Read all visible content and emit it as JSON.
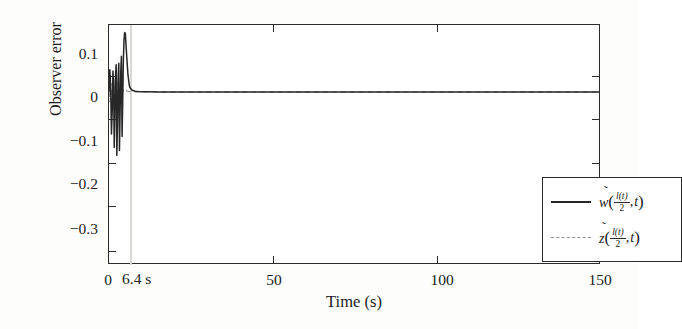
{
  "chart_data": {
    "type": "line",
    "title": "",
    "xlabel": "Time (s)",
    "ylabel": "Observer error",
    "xlim": [
      0,
      150
    ],
    "ylim": [
      -0.345,
      0.135
    ],
    "xticks": [
      0,
      50,
      100,
      150
    ],
    "xticklabels": [
      "0",
      "50",
      "100",
      "150"
    ],
    "yticks": [
      0.1,
      0,
      -0.1,
      -0.2,
      -0.3
    ],
    "yticklabels": [
      "0.1",
      "0",
      "−0.1",
      "−0.2",
      "−0.3"
    ],
    "grid": false,
    "legend_position": "center-right",
    "annotations": [
      {
        "text": "6.4 s",
        "x": 6.4,
        "y": -0.345,
        "type": "settling-time-marker"
      }
    ],
    "series": [
      {
        "name": "w-tilde",
        "label_parts": {
          "symbol": "w",
          "tilde": "̃",
          "numerator": "l(t)",
          "denominator": "2",
          "second_arg": "t"
        },
        "style": "solid",
        "color": "#272727",
        "x": [
          0,
          0.25,
          0.5,
          0.75,
          1.0,
          1.2,
          1.4,
          1.6,
          1.8,
          2.0,
          2.2,
          2.4,
          2.6,
          2.8,
          3.0,
          3.2,
          3.4,
          3.6,
          3.8,
          4.0,
          4.2,
          4.4,
          4.6,
          4.8,
          5.0,
          5.4,
          5.8,
          6.2,
          6.4,
          7.0,
          8.0,
          9.0,
          10.0,
          12.0,
          15.0,
          20.0,
          30.0,
          50.0,
          75.0,
          100.0,
          125.0,
          150.0
        ],
        "y": [
          0.0,
          0.045,
          0.012,
          -0.085,
          -0.035,
          0.042,
          0.02,
          -0.112,
          -0.05,
          0.035,
          0.055,
          -0.128,
          -0.06,
          0.03,
          0.058,
          -0.118,
          -0.04,
          0.04,
          0.072,
          -0.09,
          -0.02,
          0.065,
          0.105,
          0.12,
          0.118,
          0.075,
          0.035,
          0.014,
          0.009,
          0.004,
          0.0015,
          0.0008,
          0.0004,
          0.0002,
          0.0001,
          0.0,
          0.0,
          0.0,
          0.0,
          0.0,
          0.0,
          0.0
        ]
      },
      {
        "name": "z-tilde",
        "label_parts": {
          "symbol": "z",
          "tilde": "̃",
          "numerator": "l(t)",
          "denominator": "2",
          "second_arg": "t"
        },
        "style": "dashed",
        "color": "#8d8d8d",
        "x": [
          0,
          0.3,
          0.6,
          0.9,
          1.2,
          1.6,
          2.0,
          2.4,
          2.8,
          3.2,
          3.6,
          4.0,
          4.5,
          5.0,
          5.5,
          6.0,
          6.4,
          7.0,
          8.0,
          10.0,
          15.0,
          25.0,
          50.0,
          80.0,
          110.0,
          150.0
        ],
        "y": [
          0.0,
          -0.02,
          0.018,
          -0.03,
          0.022,
          -0.035,
          0.028,
          -0.03,
          0.02,
          -0.018,
          0.014,
          -0.01,
          0.007,
          0.004,
          0.002,
          0.001,
          0.0008,
          0.0005,
          0.0003,
          0.0001,
          0.0,
          0.0,
          0.0,
          0.0,
          0.0,
          0.0
        ]
      }
    ]
  },
  "figure": {
    "background_color": "#fdfdfc",
    "axis_color": "#2b2b2b",
    "annotation_line_color": "#d8d8d4"
  }
}
